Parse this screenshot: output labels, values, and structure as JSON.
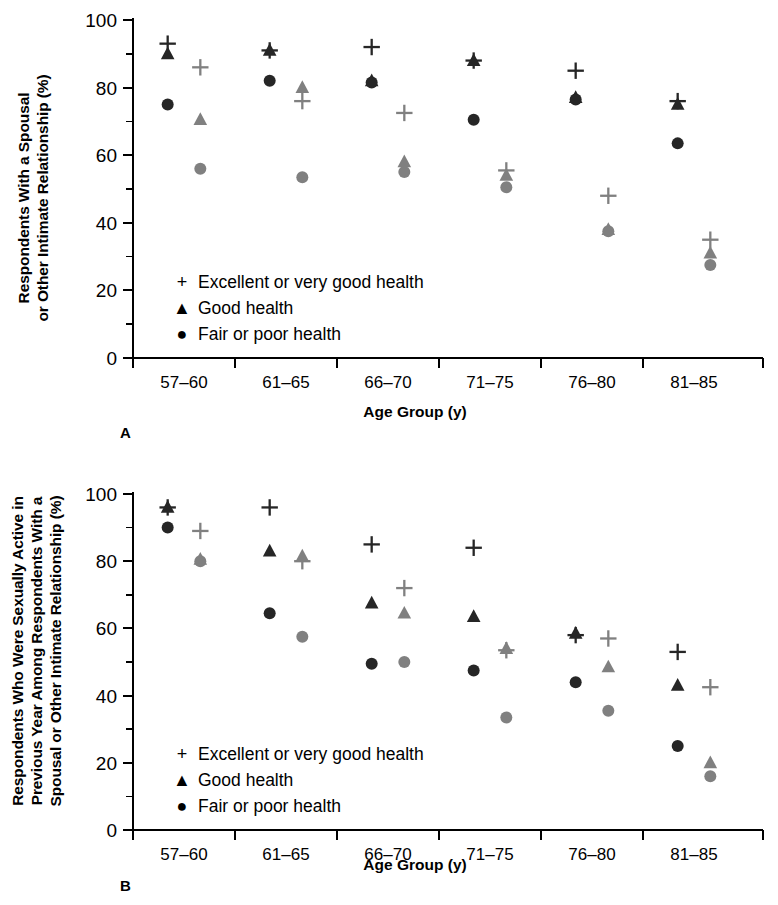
{
  "figure": {
    "panels": [
      {
        "letter": "A",
        "ylabel_lines": [
          "Respondents With a Spousal",
          "or Other Intimate Relationship (%)"
        ],
        "xlabel": "Age Group (y)"
      },
      {
        "letter": "B",
        "ylabel_lines": [
          "Respondents Who Were Sexually Active in",
          "Previous Year Among Respondents With a",
          "Spousal or Other Intimate Relationship (%)"
        ],
        "xlabel": "Age Group (y)"
      }
    ],
    "legend": {
      "items": [
        {
          "glyph": "+",
          "label": "Excellent or very good health",
          "marker": "plus"
        },
        {
          "glyph": "▲",
          "label": "Good health",
          "marker": "triangle"
        },
        {
          "glyph": "●",
          "label": "Fair or poor health",
          "marker": "circle"
        }
      ]
    },
    "colors": {
      "dark_series": "#262626",
      "light_series": "#808080",
      "axis": "#000000",
      "background": "#ffffff"
    }
  },
  "chart_data": [
    {
      "type": "scatter",
      "panel": "A",
      "title": "",
      "xlabel": "Age Group (y)",
      "ylabel": "Respondents With a Spousal or Other Intimate Relationship (%)",
      "categories": [
        "57–60",
        "61–65",
        "66–70",
        "71–75",
        "76–80",
        "81–85"
      ],
      "ylim": [
        0,
        100
      ],
      "ytick_major": [
        0,
        20,
        40,
        60,
        80,
        100
      ],
      "ytick_minor": [
        10,
        30,
        50,
        70,
        90
      ],
      "grid": false,
      "legend_position": "inside-lower-left",
      "series": [
        {
          "name": "Excellent or very good health (men)",
          "marker": "plus",
          "color": "#262626",
          "group_offset": -0.16,
          "values": [
            93,
            91,
            92,
            88,
            85,
            76
          ]
        },
        {
          "name": "Good health (men)",
          "marker": "triangle",
          "color": "#262626",
          "group_offset": -0.16,
          "values": [
            90,
            91,
            82,
            88,
            77,
            75
          ]
        },
        {
          "name": "Fair or poor health (men)",
          "marker": "circle",
          "color": "#262626",
          "group_offset": -0.16,
          "values": [
            75,
            82,
            81.5,
            70.5,
            76.5,
            63.5
          ]
        },
        {
          "name": "Excellent or very good health (women)",
          "marker": "plus",
          "color": "#808080",
          "group_offset": 0.16,
          "values": [
            86,
            76,
            72.5,
            55.5,
            48,
            35
          ]
        },
        {
          "name": "Good health (women)",
          "marker": "triangle",
          "color": "#808080",
          "group_offset": 0.16,
          "values": [
            70.5,
            80,
            58,
            54,
            38,
            31
          ]
        },
        {
          "name": "Fair or poor health (women)",
          "marker": "circle",
          "color": "#808080",
          "group_offset": 0.16,
          "values": [
            56,
            53.5,
            55,
            50.5,
            37.5,
            27.5
          ]
        }
      ]
    },
    {
      "type": "scatter",
      "panel": "B",
      "title": "",
      "xlabel": "Age Group (y)",
      "ylabel": "Respondents Who Were Sexually Active in Previous Year Among Respondents With a Spousal or Other Intimate Relationship (%)",
      "categories": [
        "57–60",
        "61–65",
        "66–70",
        "71–75",
        "76–80",
        "81–85"
      ],
      "ylim": [
        0,
        100
      ],
      "ytick_major": [
        0,
        20,
        40,
        60,
        80,
        100
      ],
      "ytick_minor": [
        10,
        30,
        50,
        70,
        90
      ],
      "grid": false,
      "legend_position": "inside-lower-left",
      "series": [
        {
          "name": "Excellent or very good health (men)",
          "marker": "plus",
          "color": "#262626",
          "group_offset": -0.16,
          "values": [
            96,
            96,
            85,
            84,
            58,
            53
          ]
        },
        {
          "name": "Good health (men)",
          "marker": "triangle",
          "color": "#262626",
          "group_offset": -0.16,
          "values": [
            96,
            83,
            67.5,
            63.5,
            58.5,
            43
          ]
        },
        {
          "name": "Fair or poor health (men)",
          "marker": "circle",
          "color": "#262626",
          "group_offset": -0.16,
          "values": [
            90,
            64.5,
            49.5,
            47.5,
            44,
            25
          ]
        },
        {
          "name": "Excellent or very good health (women)",
          "marker": "plus",
          "color": "#808080",
          "group_offset": 0.16,
          "values": [
            89,
            80,
            72,
            53.5,
            57,
            42.5
          ]
        },
        {
          "name": "Good health (women)",
          "marker": "triangle",
          "color": "#808080",
          "group_offset": 0.16,
          "values": [
            80.5,
            81.5,
            64.5,
            54,
            48.5,
            20
          ]
        },
        {
          "name": "Fair or poor health (women)",
          "marker": "circle",
          "color": "#808080",
          "group_offset": 0.16,
          "values": [
            80,
            57.5,
            50,
            33.5,
            35.5,
            16
          ]
        }
      ]
    }
  ]
}
